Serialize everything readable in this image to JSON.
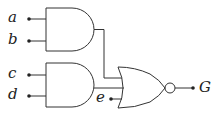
{
  "diagram": {
    "type": "logic-circuit",
    "inputs": [
      {
        "label": "a",
        "x": 8,
        "y": 10
      },
      {
        "label": "b",
        "x": 8,
        "y": 32
      },
      {
        "label": "c",
        "x": 8,
        "y": 66
      },
      {
        "label": "d",
        "x": 8,
        "y": 87
      },
      {
        "label": "e",
        "x": 96,
        "y": 90
      }
    ],
    "output": {
      "label": "G",
      "x": 199,
      "y": 80
    },
    "gates": [
      {
        "id": "and1",
        "type": "AND",
        "inputs": [
          "a",
          "b"
        ]
      },
      {
        "id": "and2",
        "type": "AND",
        "inputs": [
          "c",
          "d"
        ]
      },
      {
        "id": "nor1",
        "type": "NOR",
        "inputs": [
          "and1",
          "and2",
          "e"
        ],
        "output": "G"
      }
    ],
    "colors": {
      "line": "#333333",
      "text": "#222222",
      "background": "#ffffff"
    }
  }
}
